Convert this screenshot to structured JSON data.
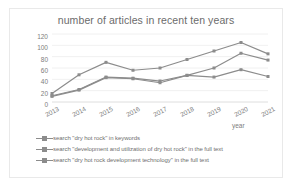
{
  "chart_data": {
    "type": "line",
    "title": "number of articles in recent ten years",
    "xlabel": "year",
    "ylabel": "number",
    "categories": [
      "2013",
      "2014",
      "2015",
      "2016",
      "2017",
      "2018",
      "2019",
      "2020",
      "2021"
    ],
    "ylim": [
      0,
      120
    ],
    "yticks": [
      "0",
      "20",
      "40",
      "60",
      "80",
      "100",
      "120"
    ],
    "grid": true,
    "legend_position": "bottom-left",
    "series": [
      {
        "name": "search \"dry hot rock\" in keywords",
        "color": "#8c8c8c",
        "values": [
          15,
          48,
          70,
          56,
          60,
          75,
          90,
          105,
          85
        ]
      },
      {
        "name": "search \"development and utilization of dry hot rock\" in the full text",
        "color": "#8c8c8c",
        "values": [
          11,
          22,
          44,
          42,
          37,
          47,
          60,
          86,
          74
        ]
      },
      {
        "name": "search \"dry hot rock development technology\" in the full text",
        "color": "#8c8c8c",
        "values": [
          10,
          21,
          43,
          41,
          34,
          47,
          44,
          57,
          45
        ]
      }
    ]
  }
}
